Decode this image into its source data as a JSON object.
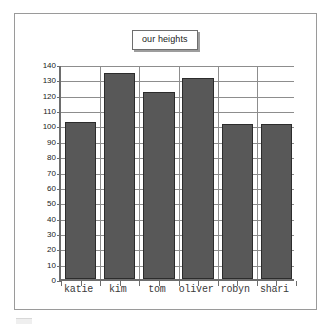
{
  "chart_data": {
    "type": "bar",
    "title": "our heights",
    "xlabel": "",
    "ylabel": "",
    "categories": [
      "katie",
      "kim",
      "tom",
      "oliver",
      "robyn",
      "shari"
    ],
    "values": [
      102,
      134,
      122,
      131,
      101,
      101
    ],
    "ylim": [
      0,
      140
    ],
    "ytick_step": 10,
    "yticks": [
      140,
      130,
      120,
      110,
      100,
      90,
      80,
      70,
      60,
      50,
      40,
      30,
      20,
      10,
      0
    ],
    "ytick_labels": [
      "140",
      "130",
      "120",
      "110",
      "100",
      "90",
      "80",
      "70",
      "60",
      "50",
      "40",
      "30",
      "20",
      "10",
      "0"
    ],
    "grid": true,
    "grid_horizontal": true,
    "grid_vertical": true,
    "legend": false,
    "legend_position": "none",
    "series": [
      {
        "name": "our heights",
        "values": [
          102,
          134,
          122,
          131,
          101,
          101
        ]
      }
    ],
    "colors": {
      "bar_fill": "#585858",
      "bar_edge": "#2c2c2c",
      "grid": "#8d8d8d",
      "axis": "#6d6d6d",
      "frame": "#9a9a9a",
      "background": "#ffffff",
      "title_text": "#1b1b1b",
      "tick_text": "#222222",
      "category_text": "#3a3a3a"
    }
  }
}
